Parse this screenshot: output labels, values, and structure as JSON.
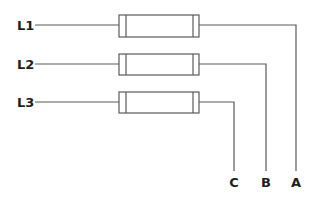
{
  "diagram": {
    "type": "wiring / fuse diagram",
    "colors": {
      "stroke": "#5a5a5a",
      "text": "#1e1e1e",
      "background": "#ffffff"
    },
    "inputs": [
      {
        "label": "L1",
        "y": 25
      },
      {
        "label": "L2",
        "y": 64
      },
      {
        "label": "L3",
        "y": 102
      }
    ],
    "components": [
      {
        "name": "fuse-1",
        "x": 119,
        "y": 15,
        "w": 80,
        "h": 22
      },
      {
        "name": "fuse-2",
        "x": 119,
        "y": 54,
        "w": 80,
        "h": 21
      },
      {
        "name": "fuse-3",
        "x": 119,
        "y": 92,
        "w": 80,
        "h": 21
      }
    ],
    "outputs": [
      {
        "label": "A",
        "x": 296,
        "from": "L1"
      },
      {
        "label": "B",
        "x": 266,
        "from": "L2"
      },
      {
        "label": "C",
        "x": 234,
        "from": "L3"
      }
    ]
  }
}
